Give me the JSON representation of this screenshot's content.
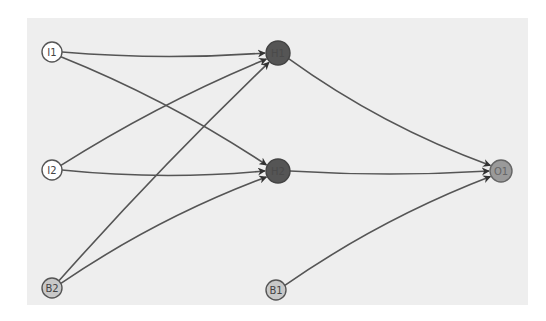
{
  "diagram": {
    "type": "neural-network",
    "panel_color": "#eeeeee",
    "edge_color": "#555555",
    "nodes": [
      {
        "id": "I1",
        "label": "I1",
        "layer": "input",
        "x": 52,
        "y": 52,
        "r": 10,
        "fill": "#ffffff",
        "stroke": "#555555",
        "text_color": "#444444"
      },
      {
        "id": "I2",
        "label": "I2",
        "layer": "input",
        "x": 52,
        "y": 170,
        "r": 10,
        "fill": "#ffffff",
        "stroke": "#555555",
        "text_color": "#444444"
      },
      {
        "id": "B2",
        "label": "B2",
        "layer": "bias",
        "x": 52,
        "y": 288,
        "r": 10,
        "fill": "#c8c8c8",
        "stroke": "#555555",
        "text_color": "#444444"
      },
      {
        "id": "H1",
        "label": "H1",
        "layer": "hidden",
        "x": 278,
        "y": 53,
        "r": 12,
        "fill": "#555555",
        "stroke": "#444444",
        "text_color": "#4a4a4a"
      },
      {
        "id": "H2",
        "label": "H2",
        "layer": "hidden",
        "x": 278,
        "y": 171,
        "r": 12,
        "fill": "#555555",
        "stroke": "#444444",
        "text_color": "#4a4a4a"
      },
      {
        "id": "O1",
        "label": "O1",
        "layer": "output",
        "x": 501,
        "y": 171,
        "r": 11,
        "fill": "#9a9a9a",
        "stroke": "#666666",
        "text_color": "#666666"
      },
      {
        "id": "B1",
        "label": "B1",
        "layer": "bias",
        "x": 276,
        "y": 290,
        "r": 10,
        "fill": "#c8c8c8",
        "stroke": "#555555",
        "text_color": "#444444"
      }
    ],
    "edges": [
      {
        "from": "I1",
        "to": "H1",
        "bend": 8
      },
      {
        "from": "I1",
        "to": "H2",
        "bend": -12
      },
      {
        "from": "I2",
        "to": "H1",
        "bend": -10
      },
      {
        "from": "I2",
        "to": "H2",
        "bend": 10
      },
      {
        "from": "B2",
        "to": "H1",
        "bend": -6
      },
      {
        "from": "B2",
        "to": "H2",
        "bend": -14
      },
      {
        "from": "H1",
        "to": "O1",
        "bend": 16
      },
      {
        "from": "H2",
        "to": "O1",
        "bend": 6
      },
      {
        "from": "B1",
        "to": "O1",
        "bend": -14
      }
    ]
  }
}
